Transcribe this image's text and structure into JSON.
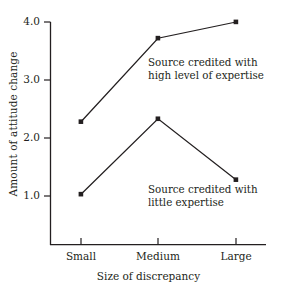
{
  "chart_data": {
    "type": "line",
    "title": "",
    "xlabel": "Size of discrepancy",
    "ylabel": "Amount of attitude change",
    "categories": [
      "Small",
      "Medium",
      "Large"
    ],
    "x_tick_labels": [
      "Small",
      "Medium",
      "Large"
    ],
    "y_tick_labels": [
      "1.0",
      "2.0",
      "3.0",
      "4.0"
    ],
    "y_ticks": [
      1.0,
      2.0,
      3.0,
      4.0
    ],
    "ylim": [
      0.55,
      4.15
    ],
    "grid": false,
    "legend_position": "inline-annotations",
    "series": [
      {
        "name": "Source credited with high level of expertise",
        "values": [
          2.28,
          3.72,
          4.0
        ],
        "marker": "filled-square",
        "color": "#231f20"
      },
      {
        "name": "Source credited with little expertise",
        "values": [
          1.03,
          2.33,
          1.28
        ],
        "marker": "filled-square",
        "color": "#231f20"
      }
    ],
    "annotations": [
      {
        "id": "high-expertise-annotation",
        "line1": "Source credited with",
        "line2": "high level of expertise"
      },
      {
        "id": "little-expertise-annotation",
        "line1": "Source credited with",
        "line2": "little expertise"
      }
    ],
    "axis_color": "#231f20",
    "background_color": "#ffffff"
  },
  "axis": {
    "y_label": "Amount of attitude change",
    "x_label": "Size of discrepancy",
    "y_tick_1": "1.0",
    "y_tick_2": "2.0",
    "y_tick_3": "3.0",
    "y_tick_4": "4.0",
    "x_tick_1": "Small",
    "x_tick_2": "Medium",
    "x_tick_3": "Large"
  },
  "annotations": {
    "high": {
      "line1": "Source credited with",
      "line2": "high level of expertise"
    },
    "little": {
      "line1": "Source credited with",
      "line2": "little expertise"
    }
  }
}
